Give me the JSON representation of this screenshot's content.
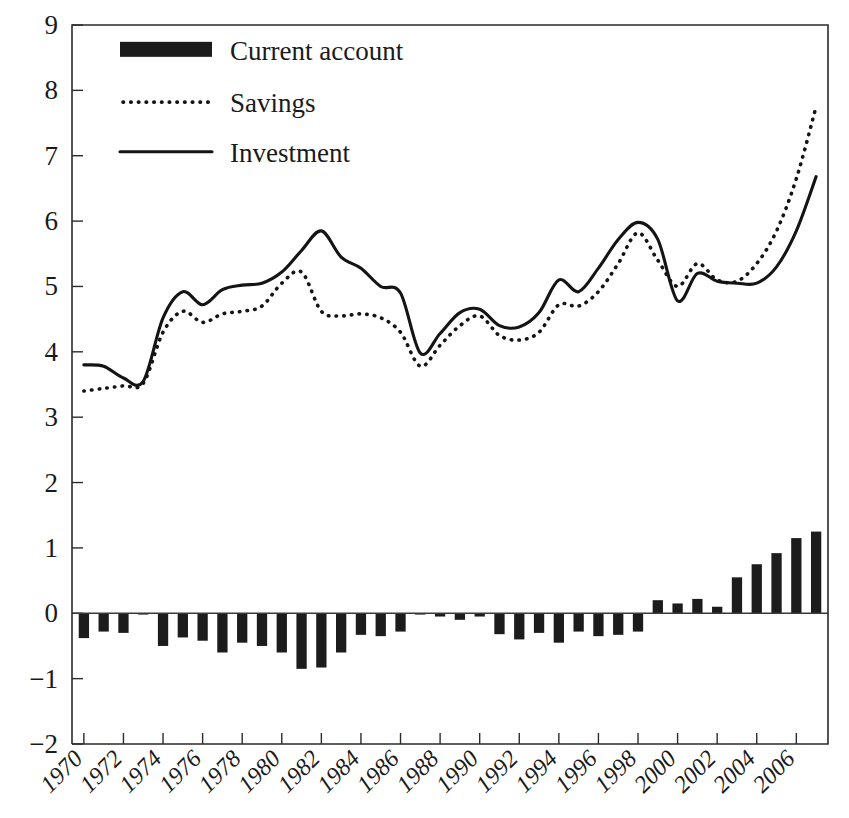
{
  "chart_data": {
    "type": "line",
    "title": "",
    "subtitle": "",
    "xlabel": "",
    "ylabel": "",
    "xlim": [
      1969.4,
      2007.6
    ],
    "ylim": [
      -2,
      9
    ],
    "grid": false,
    "legend_position": "top-left",
    "y_ticks": [
      "9",
      "8",
      "7",
      "6",
      "5",
      "4",
      "3",
      "2",
      "1",
      "0",
      "−1",
      "−2"
    ],
    "y_tick_values": [
      9,
      8,
      7,
      6,
      5,
      4,
      3,
      2,
      1,
      0,
      -1,
      -2
    ],
    "x_ticks": [
      "1970",
      "1972",
      "1974",
      "1976",
      "1978",
      "1980",
      "1982",
      "1984",
      "1986",
      "1988",
      "1990",
      "1992",
      "1994",
      "1996",
      "1998",
      "2000",
      "2002",
      "2004",
      "2006"
    ],
    "x_tick_values": [
      1970,
      1972,
      1974,
      1976,
      1978,
      1980,
      1982,
      1984,
      1986,
      1988,
      1990,
      1992,
      1994,
      1996,
      1998,
      2000,
      2002,
      2004,
      2006
    ],
    "x": [
      1970,
      1971,
      1972,
      1973,
      1974,
      1975,
      1976,
      1977,
      1978,
      1979,
      1980,
      1981,
      1982,
      1983,
      1984,
      1985,
      1986,
      1987,
      1988,
      1989,
      1990,
      1991,
      1992,
      1993,
      1994,
      1995,
      1996,
      1997,
      1998,
      1999,
      2000,
      2001,
      2002,
      2003,
      2004,
      2005,
      2006,
      2007
    ],
    "legend": [
      {
        "name": "Current account",
        "style": "bar",
        "color": "#1c1c1c"
      },
      {
        "name": "Savings",
        "style": "dotted",
        "color": "#141414"
      },
      {
        "name": "Investment",
        "style": "solid",
        "color": "#141414"
      }
    ],
    "series": [
      {
        "name": "Current account",
        "style": "bar",
        "values": [
          -0.38,
          -0.28,
          -0.3,
          -0.02,
          -0.5,
          -0.37,
          -0.42,
          -0.6,
          -0.45,
          -0.5,
          -0.6,
          -0.85,
          -0.83,
          -0.6,
          -0.33,
          -0.35,
          -0.28,
          -0.02,
          -0.05,
          -0.1,
          -0.05,
          -0.32,
          -0.4,
          -0.3,
          -0.45,
          -0.28,
          -0.35,
          -0.33,
          -0.28,
          0.2,
          0.15,
          0.22,
          0.1,
          0.55,
          0.75,
          0.92,
          1.15,
          1.25
        ]
      },
      {
        "name": "Savings",
        "style": "dotted",
        "values": [
          3.4,
          3.44,
          3.48,
          3.52,
          4.3,
          4.62,
          4.45,
          4.58,
          4.62,
          4.7,
          5.05,
          5.22,
          4.62,
          4.55,
          4.58,
          4.52,
          4.3,
          3.78,
          4.1,
          4.4,
          4.55,
          4.25,
          4.18,
          4.3,
          4.72,
          4.7,
          4.92,
          5.35,
          5.82,
          5.4,
          5.0,
          5.35,
          5.1,
          5.08,
          5.35,
          5.85,
          6.65,
          7.75
        ]
      },
      {
        "name": "Investment",
        "style": "solid",
        "values": [
          3.8,
          3.78,
          3.6,
          3.55,
          4.52,
          4.92,
          4.72,
          4.95,
          5.02,
          5.05,
          5.22,
          5.55,
          5.85,
          5.45,
          5.28,
          5.0,
          4.9,
          3.98,
          4.28,
          4.6,
          4.65,
          4.4,
          4.38,
          4.6,
          5.1,
          4.92,
          5.28,
          5.72,
          5.98,
          5.72,
          4.78,
          5.2,
          5.08,
          5.05,
          5.05,
          5.3,
          5.85,
          6.68
        ]
      }
    ]
  }
}
